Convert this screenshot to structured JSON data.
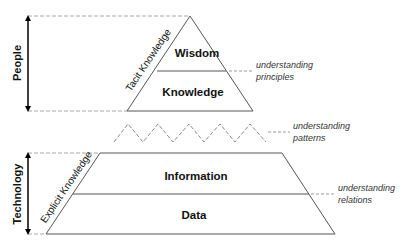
{
  "diagram": {
    "side_labels": {
      "people": "People",
      "technology": "Technology"
    },
    "diagonal_labels": {
      "tacit": "Tacit Knowledge",
      "explicit": "Explicit Knowledge"
    },
    "levels": [
      {
        "name": "Wisdom"
      },
      {
        "name": "Knowledge"
      },
      {
        "name": "Information"
      },
      {
        "name": "Data"
      }
    ],
    "annotations": {
      "principles_line1": "understanding",
      "principles_line2": "principles",
      "patterns_line1": "understanding",
      "patterns_line2": "patterns",
      "relations_line1": "understanding",
      "relations_line2": "relations"
    },
    "colors": {
      "line": "#555555",
      "dash": "#9a9a9a",
      "text": "#111111"
    }
  }
}
